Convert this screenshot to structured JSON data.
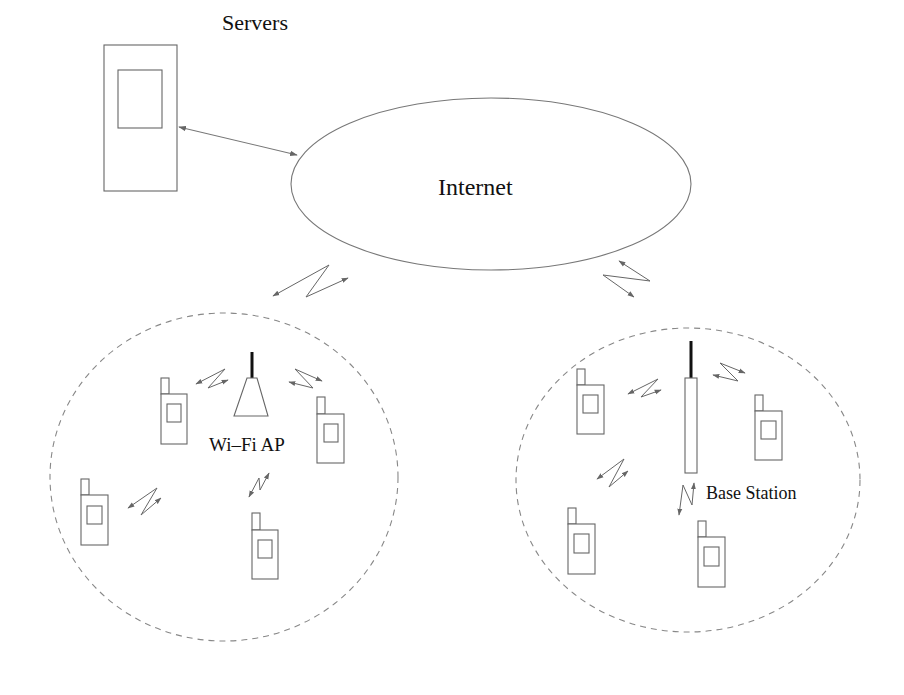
{
  "diagram": {
    "type": "network-architecture",
    "labels": {
      "servers": "Servers",
      "internet": "Internet",
      "wifi_ap": "Wi–Fi AP",
      "base_station": "Base Station"
    },
    "nodes": [
      {
        "id": "servers",
        "kind": "server",
        "label": "Servers"
      },
      {
        "id": "internet",
        "kind": "cloud-ellipse",
        "label": "Internet"
      },
      {
        "id": "wifi_ap",
        "kind": "access-point",
        "label": "Wi–Fi AP"
      },
      {
        "id": "base_station",
        "kind": "cell-tower",
        "label": "Base Station"
      }
    ],
    "zones": [
      {
        "id": "wifi-zone",
        "style": "dashed-circle",
        "contains": [
          "wifi_ap"
        ],
        "mobile_count": 4
      },
      {
        "id": "cellular-zone",
        "style": "dashed-circle",
        "contains": [
          "base_station"
        ],
        "mobile_count": 4
      }
    ],
    "links": [
      {
        "from": "servers",
        "to": "internet",
        "style": "double-arrow"
      },
      {
        "from": "internet",
        "to": "wifi-zone",
        "style": "wireless-zigzag"
      },
      {
        "from": "internet",
        "to": "cellular-zone",
        "style": "wireless-zigzag"
      }
    ],
    "colors": {
      "stroke": "#777777",
      "antenna": "#111111",
      "zone_dash": "#888888",
      "text": "#111111",
      "background": "#ffffff"
    }
  }
}
